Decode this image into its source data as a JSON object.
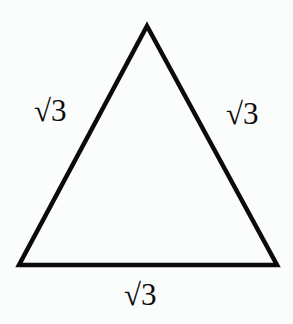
{
  "figure": {
    "name": "equilateral-triangle-with-side-labels",
    "background_color": "#fbfcfc",
    "stroke_color": "#0b0b0b",
    "text_color": "#0b0b0b",
    "stroke_width": 4.5,
    "shape": {
      "type": "triangle",
      "vertices": [
        {
          "name": "apex",
          "x": 147,
          "y": 26
        },
        {
          "name": "bottom-right",
          "x": 277,
          "y": 265
        },
        {
          "name": "bottom-left",
          "x": 19,
          "y": 265
        }
      ],
      "filled": false
    },
    "labels": {
      "left": "√3",
      "right": "√3",
      "bottom": "√3"
    }
  }
}
